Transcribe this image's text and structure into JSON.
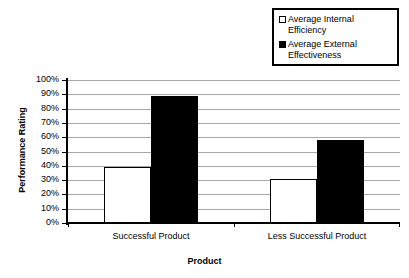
{
  "chart_data": {
    "type": "bar",
    "title": "",
    "xlabel": "Product",
    "ylabel": "Performance Rating",
    "categories": [
      "Successful Product",
      "Less Successful Product"
    ],
    "series": [
      {
        "name": "Average Internal Efficiency",
        "values": [
          39,
          31
        ],
        "color": "#ffffff",
        "border_color": "#000000",
        "swatch": "fill-white"
      },
      {
        "name": "Average External Effectiveness",
        "values": [
          89,
          58
        ],
        "color": "#000000",
        "border_color": "#000000",
        "swatch": "fill-black"
      }
    ],
    "ylim": [
      0,
      100
    ],
    "ytick_step": 10,
    "ytick_labels": [
      "100%",
      "90%",
      "80%",
      "70%",
      "60%",
      "50%",
      "40%",
      "30%",
      "20%",
      "10%",
      "0%"
    ],
    "grid": true,
    "grid_color": "#a8a8a8",
    "legend_position": "top-right",
    "legend": [
      {
        "label": "Average Internal\nEfficiency",
        "swatch": "fill-white"
      },
      {
        "label": "Average External\nEffectiveness",
        "swatch": "fill-black"
      }
    ]
  }
}
